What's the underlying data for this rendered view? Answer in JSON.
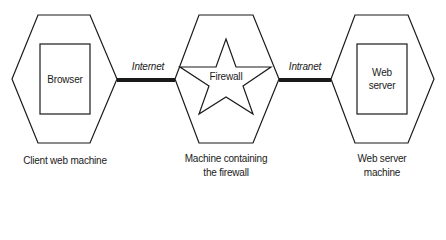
{
  "diagram": {
    "type": "network-architecture",
    "nodes": [
      {
        "id": "client",
        "shape": "hexagon",
        "inner_shape": "rectangle",
        "inner_label": "Browser",
        "caption": [
          "Client web machine"
        ]
      },
      {
        "id": "firewall",
        "shape": "hexagon",
        "inner_shape": "star",
        "inner_label": "Firewall",
        "caption": [
          "Machine containing",
          "the firewall"
        ]
      },
      {
        "id": "server",
        "shape": "hexagon",
        "inner_shape": "rectangle",
        "inner_label": [
          "Web",
          "server"
        ],
        "caption": [
          "Web server",
          "machine"
        ]
      }
    ],
    "edges": [
      {
        "from": "client",
        "to": "firewall",
        "label": "Internet",
        "style": "thick-line"
      },
      {
        "from": "firewall",
        "to": "server",
        "label": "Intranet",
        "style": "thick-line"
      }
    ]
  },
  "labels": {
    "browser": "Browser",
    "firewall": "Firewall",
    "web_server_1": "Web",
    "web_server_2": "server",
    "internet": "Internet",
    "intranet": "Intranet",
    "client_caption": "Client web machine",
    "firewall_caption_1": "Machine containing",
    "firewall_caption_2": "the firewall",
    "server_caption_1": "Web server",
    "server_caption_2": "machine"
  },
  "colors": {
    "stroke": "#1a1a1a",
    "background": "#ffffff"
  }
}
